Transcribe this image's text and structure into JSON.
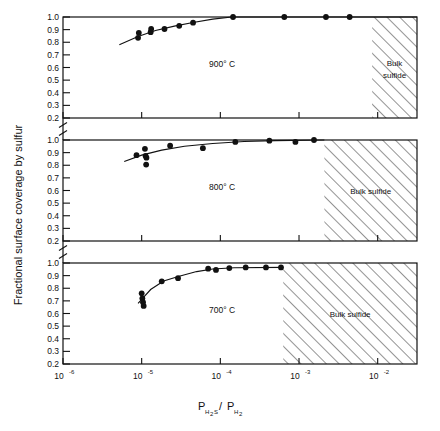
{
  "chart_data": {
    "type": "scatter",
    "title": "",
    "xlabel": "P_H2S / P_H2",
    "xlabel_parts": {
      "p1": "P",
      "sub1": "H",
      "sub1b": "2",
      "s": "S",
      "slash": "/",
      "p2": "P",
      "sub2": "H",
      "sub2b": "2"
    },
    "ylabel": "Fractional surface coverage by sulfur",
    "xscale": "log",
    "xlim": [
      1e-06,
      0.0316
    ],
    "ylim": [
      0.2,
      1.0
    ],
    "grid": false,
    "legend": "none",
    "xticks": [
      {
        "value": 1e-06,
        "mant": "10",
        "exp": "-6"
      },
      {
        "value": 1e-05,
        "mant": "10",
        "exp": "-5"
      },
      {
        "value": 0.0001,
        "mant": "10",
        "exp": "-4"
      },
      {
        "value": 0.001,
        "mant": "10",
        "exp": "-3"
      },
      {
        "value": 0.01,
        "mant": "10",
        "exp": "-2"
      }
    ],
    "yticks_major": [
      "1.0",
      "0.9",
      "0.8",
      "0.7",
      "0.6",
      "0.5",
      "0.4",
      "0.3",
      "0.2"
    ],
    "yticks_values": [
      1.0,
      0.9,
      0.8,
      0.7,
      0.6,
      0.5,
      0.4,
      0.3,
      0.2
    ],
    "panels": [
      {
        "id": "panel-900",
        "label": "900° C",
        "temperature_c": 900,
        "bulk_label": "Bulk sulfide",
        "bulk_region_start": 0.0085,
        "points": [
          {
            "x": 9e-06,
            "y": 0.835
          },
          {
            "x": 9.2e-06,
            "y": 0.875
          },
          {
            "x": 1.3e-05,
            "y": 0.88
          },
          {
            "x": 1.32e-05,
            "y": 0.905
          },
          {
            "x": 1.95e-05,
            "y": 0.905
          },
          {
            "x": 3e-05,
            "y": 0.93
          },
          {
            "x": 4.5e-05,
            "y": 0.955
          },
          {
            "x": 0.000145,
            "y": 1.0
          },
          {
            "x": 0.00065,
            "y": 1.0
          },
          {
            "x": 0.0022,
            "y": 1.0
          },
          {
            "x": 0.0044,
            "y": 1.0
          }
        ],
        "curve": [
          {
            "x": 5.2e-06,
            "y": 0.78
          },
          {
            "x": 9e-06,
            "y": 0.845
          },
          {
            "x": 1.5e-05,
            "y": 0.893
          },
          {
            "x": 2.6e-05,
            "y": 0.928
          },
          {
            "x": 4.5e-05,
            "y": 0.957
          },
          {
            "x": 8e-05,
            "y": 0.983
          },
          {
            "x": 0.00014,
            "y": 1.0
          },
          {
            "x": 0.0316,
            "y": 1.0
          }
        ]
      },
      {
        "id": "panel-800",
        "label": "800° C",
        "temperature_c": 800,
        "bulk_label": "Bulk sulfide",
        "bulk_region_start": 0.0021,
        "points": [
          {
            "x": 8.6e-06,
            "y": 0.88
          },
          {
            "x": 1.1e-05,
            "y": 0.93
          },
          {
            "x": 1.12e-05,
            "y": 0.875
          },
          {
            "x": 1.14e-05,
            "y": 0.805
          },
          {
            "x": 1.15e-05,
            "y": 0.86
          },
          {
            "x": 2.3e-05,
            "y": 0.955
          },
          {
            "x": 6e-05,
            "y": 0.935
          },
          {
            "x": 0.000155,
            "y": 0.985
          },
          {
            "x": 0.00042,
            "y": 0.995
          },
          {
            "x": 0.0009,
            "y": 0.985
          },
          {
            "x": 0.00155,
            "y": 1.0
          }
        ],
        "curve": [
          {
            "x": 6e-06,
            "y": 0.83
          },
          {
            "x": 1e-05,
            "y": 0.88
          },
          {
            "x": 1.8e-05,
            "y": 0.92
          },
          {
            "x": 3.5e-05,
            "y": 0.95
          },
          {
            "x": 8e-05,
            "y": 0.972
          },
          {
            "x": 0.0002,
            "y": 0.988
          },
          {
            "x": 0.0005,
            "y": 0.995
          },
          {
            "x": 0.0021,
            "y": 1.0
          }
        ]
      },
      {
        "id": "panel-700",
        "label": "700° C",
        "temperature_c": 700,
        "bulk_label": "Bulk sulfide",
        "bulk_region_start": 0.00063,
        "points": [
          {
            "x": 1e-05,
            "y": 0.76
          },
          {
            "x": 1.02e-05,
            "y": 0.72
          },
          {
            "x": 1.04e-05,
            "y": 0.69
          },
          {
            "x": 1.06e-05,
            "y": 0.66
          },
          {
            "x": 1.8e-05,
            "y": 0.855
          },
          {
            "x": 2.9e-05,
            "y": 0.88
          },
          {
            "x": 7e-05,
            "y": 0.955
          },
          {
            "x": 8.8e-05,
            "y": 0.945
          },
          {
            "x": 0.00013,
            "y": 0.96
          },
          {
            "x": 0.00021,
            "y": 0.965
          },
          {
            "x": 0.00038,
            "y": 0.965
          },
          {
            "x": 0.00059,
            "y": 0.965
          }
        ],
        "curve": [
          {
            "x": 9e-06,
            "y": 0.68
          },
          {
            "x": 1.3e-05,
            "y": 0.79
          },
          {
            "x": 1.9e-05,
            "y": 0.858
          },
          {
            "x": 3e-05,
            "y": 0.895
          },
          {
            "x": 5e-05,
            "y": 0.932
          },
          {
            "x": 8e-05,
            "y": 0.952
          },
          {
            "x": 0.00015,
            "y": 0.962
          },
          {
            "x": 0.00063,
            "y": 0.965
          }
        ]
      }
    ]
  }
}
